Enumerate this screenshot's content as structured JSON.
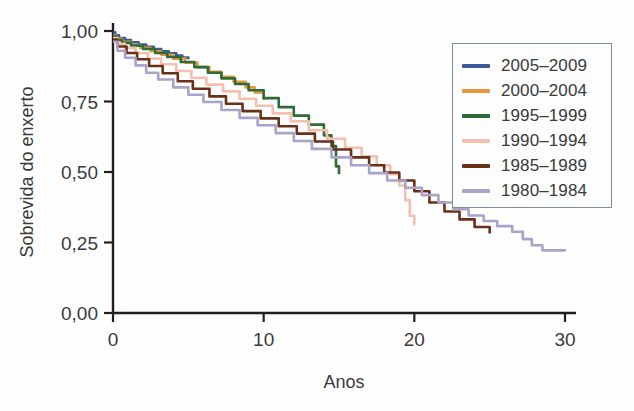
{
  "chart_data": {
    "type": "line",
    "title": "",
    "xlabel": "Anos",
    "ylabel": "Sobrevida do enxerto",
    "xlim": [
      0,
      30
    ],
    "ylim": [
      0,
      1.0
    ],
    "xticks": [
      0,
      10,
      20,
      30
    ],
    "xtick_labels": [
      "0",
      "10",
      "20",
      "30"
    ],
    "yticks": [
      0.0,
      0.25,
      0.5,
      0.75,
      1.0
    ],
    "ytick_labels": [
      "0,00",
      "0,25",
      "0,50",
      "0,75",
      "1,00"
    ],
    "grid": false,
    "legend_position": "upper right",
    "decimal_separator": ",",
    "series": [
      {
        "name": "2005–2009",
        "color": "#3c5a96",
        "x": [
          0,
          0.15,
          0.4,
          0.8,
          1.2,
          1.7,
          2.2,
          2.7,
          3.2,
          3.7,
          4.2,
          4.6,
          5.0
        ],
        "y": [
          0.995,
          0.985,
          0.975,
          0.968,
          0.96,
          0.952,
          0.944,
          0.936,
          0.928,
          0.921,
          0.913,
          0.906,
          0.9
        ]
      },
      {
        "name": "2000–2004",
        "color": "#e8963c",
        "x": [
          0,
          0.2,
          0.6,
          1.2,
          1.8,
          2.5,
          3.2,
          4.0,
          4.8,
          5.6,
          6.4,
          7.2,
          8.0,
          8.8,
          9.4,
          10.0
        ],
        "y": [
          0.985,
          0.972,
          0.962,
          0.95,
          0.94,
          0.928,
          0.916,
          0.902,
          0.888,
          0.872,
          0.855,
          0.838,
          0.82,
          0.8,
          0.782,
          0.755
        ]
      },
      {
        "name": "1995–1999",
        "color": "#2d6b38",
        "x": [
          0,
          0.2,
          0.6,
          1.2,
          2.0,
          2.8,
          3.6,
          4.5,
          5.4,
          6.3,
          7.2,
          8.1,
          9.0,
          10.0,
          11.0,
          12.0,
          13.0,
          14.0,
          14.5,
          14.8,
          15.0
        ],
        "y": [
          0.982,
          0.968,
          0.958,
          0.948,
          0.936,
          0.922,
          0.908,
          0.89,
          0.872,
          0.852,
          0.832,
          0.812,
          0.79,
          0.762,
          0.73,
          0.7,
          0.668,
          0.63,
          0.592,
          0.52,
          0.492
        ]
      },
      {
        "name": "1990–1994",
        "color": "#f3bfae",
        "x": [
          0,
          0.3,
          0.8,
          1.5,
          2.3,
          3.2,
          4.2,
          5.2,
          6.2,
          7.3,
          8.4,
          9.5,
          10.6,
          11.8,
          13.0,
          14.2,
          15.4,
          16.5,
          17.5,
          18.4,
          19.0,
          19.4,
          19.7,
          20.0
        ],
        "y": [
          0.975,
          0.955,
          0.94,
          0.922,
          0.902,
          0.882,
          0.858,
          0.834,
          0.81,
          0.786,
          0.76,
          0.735,
          0.708,
          0.68,
          0.648,
          0.618,
          0.586,
          0.556,
          0.524,
          0.492,
          0.452,
          0.4,
          0.345,
          0.31
        ]
      },
      {
        "name": "1985–1989",
        "color": "#6b3018",
        "x": [
          0,
          0.3,
          0.9,
          1.6,
          2.4,
          3.3,
          4.3,
          5.3,
          6.4,
          7.5,
          8.6,
          9.8,
          11.0,
          12.2,
          13.4,
          14.6,
          15.8,
          17.0,
          18.0,
          19.0,
          20.0,
          21.0,
          22.0,
          23.0,
          24.0,
          25.0
        ],
        "y": [
          0.97,
          0.945,
          0.922,
          0.9,
          0.876,
          0.85,
          0.822,
          0.795,
          0.768,
          0.742,
          0.716,
          0.69,
          0.662,
          0.636,
          0.608,
          0.58,
          0.552,
          0.524,
          0.498,
          0.47,
          0.432,
          0.392,
          0.36,
          0.332,
          0.305,
          0.282
        ]
      },
      {
        "name": "1980–1984",
        "color": "#a9a2c9",
        "x": [
          0,
          0.3,
          0.8,
          1.5,
          2.2,
          3.0,
          4.0,
          5.0,
          6.0,
          7.2,
          8.4,
          9.6,
          10.8,
          12.0,
          13.2,
          14.5,
          15.8,
          17.0,
          18.2,
          19.4,
          20.5,
          21.6,
          22.6,
          23.6,
          24.6,
          25.5,
          26.5,
          27.2,
          27.8,
          28.5,
          30.0
        ],
        "y": [
          0.962,
          0.93,
          0.905,
          0.878,
          0.852,
          0.828,
          0.8,
          0.774,
          0.748,
          0.72,
          0.692,
          0.666,
          0.638,
          0.61,
          0.582,
          0.552,
          0.524,
          0.496,
          0.47,
          0.444,
          0.418,
          0.392,
          0.368,
          0.346,
          0.326,
          0.308,
          0.288,
          0.262,
          0.24,
          0.222,
          0.22
        ]
      }
    ]
  },
  "legend": {
    "items": [
      {
        "label": "2005–2009",
        "color": "#3c5a96"
      },
      {
        "label": "2000–2004",
        "color": "#e8963c"
      },
      {
        "label": "1995–1999",
        "color": "#2d6b38"
      },
      {
        "label": "1990–1994",
        "color": "#f3bfae"
      },
      {
        "label": "1985–1989",
        "color": "#6b3018"
      },
      {
        "label": "1980–1984",
        "color": "#a9a2c9"
      }
    ]
  },
  "axes": {
    "x_title": "Anos",
    "y_title": "Sobrevida do enxerto",
    "axis_color": "#231f20"
  }
}
